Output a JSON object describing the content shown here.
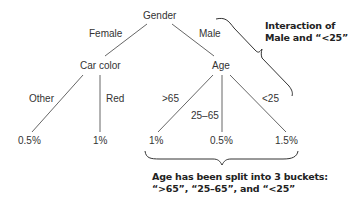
{
  "tree": {
    "root": "Gender",
    "edges": {
      "female": "Female",
      "male": "Male",
      "other": "Other",
      "red": "Red",
      "gt65": ">65",
      "mid": "25–65",
      "lt25": "<25"
    },
    "nodes": {
      "car_color": "Car color",
      "age": "Age"
    },
    "leaves": {
      "other_val": "0.5%",
      "red_val": "1%",
      "gt65_val": "1%",
      "mid_val": "0.5%",
      "lt25_val": "1.5%"
    }
  },
  "annotations": {
    "interaction_line1": "Interaction of",
    "interaction_line2": "Male and “<25”",
    "split_line1": "Age has been split into 3 buckets:",
    "split_line2": "“>65”, “25–65”, and “<25”"
  },
  "colors": {
    "line": "#555555",
    "text": "#333333"
  }
}
